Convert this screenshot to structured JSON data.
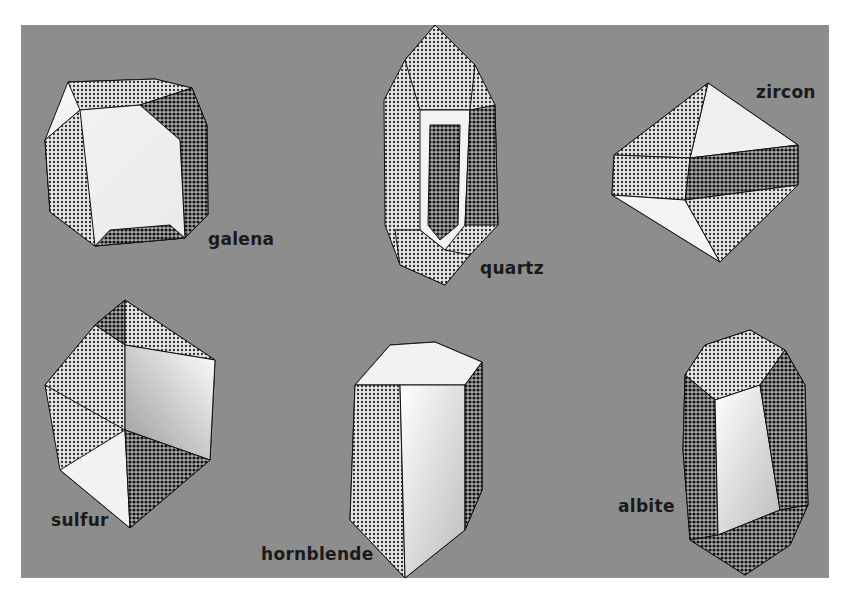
{
  "figure": {
    "background_color": "#8d8d8d",
    "crystals": [
      {
        "name": "galena",
        "label": "galena"
      },
      {
        "name": "quartz",
        "label": "quartz"
      },
      {
        "name": "zircon",
        "label": "zircon"
      },
      {
        "name": "sulfur",
        "label": "sulfur"
      },
      {
        "name": "hornblende",
        "label": "hornblende"
      },
      {
        "name": "albite",
        "label": "albite"
      }
    ]
  }
}
